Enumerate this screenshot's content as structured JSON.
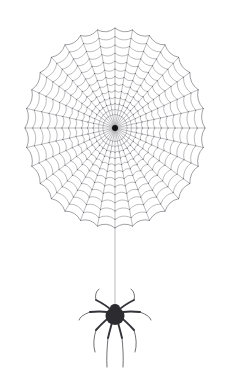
{
  "artwork": {
    "title": "Spider Web With Hanging Spider",
    "subject": "spider-web",
    "background_color": "#ffffff",
    "canvas": {
      "width": 227,
      "height": 390
    }
  },
  "web": {
    "name": "orb-web",
    "center": {
      "x": 115,
      "y": 128
    },
    "radius_x": 90,
    "radius_y": 100,
    "radial_count": 32,
    "ring_count": 13,
    "inner_hub_radius": 3,
    "first_ring_radius_fraction": 0.1,
    "sag": 0.2,
    "stroke_color": "#6b6b72",
    "stroke_width": 0.45,
    "hub_color": "#111111",
    "frame_stroke_color": "#55555c",
    "frame_stroke_width": 0.55,
    "node_color": "#3a3a42",
    "node_radius": 0.45
  },
  "dragline": {
    "name": "drop-silk-thread",
    "x": 115,
    "y_start": 228,
    "y_end": 308,
    "stroke_color": "#8d8d94",
    "stroke_width": 0.6
  },
  "spider": {
    "name": "hanging-spider",
    "center": {
      "x": 115,
      "y": 315
    },
    "abdomen_rx": 9.5,
    "abdomen_ry": 9.0,
    "cephalothorax_rx": 5.0,
    "cephalothorax_ry": 4.0,
    "body_color": "#2b2b30",
    "leg_color": "#33333a",
    "leg_count": 8,
    "leg_width_base": 1.9,
    "leg_width_tip": 0.7,
    "legs": [
      {
        "id": "leg-front-left",
        "knee_x": 96,
        "knee_y": 300,
        "tip_x": 99,
        "tip_y": 289
      },
      {
        "id": "leg-front-right",
        "knee_x": 134,
        "knee_y": 300,
        "tip_x": 131,
        "tip_y": 289
      },
      {
        "id": "leg-second-left",
        "knee_x": 90,
        "knee_y": 312,
        "tip_x": 79,
        "tip_y": 320
      },
      {
        "id": "leg-second-right",
        "knee_x": 140,
        "knee_y": 312,
        "tip_x": 151,
        "tip_y": 320
      },
      {
        "id": "leg-third-left",
        "knee_x": 96,
        "knee_y": 330,
        "tip_x": 95,
        "tip_y": 352
      },
      {
        "id": "leg-third-right",
        "knee_x": 134,
        "knee_y": 330,
        "tip_x": 135,
        "tip_y": 352
      },
      {
        "id": "leg-hind-left",
        "knee_x": 108,
        "knee_y": 338,
        "tip_x": 107,
        "tip_y": 367
      },
      {
        "id": "leg-hind-right",
        "knee_x": 122,
        "knee_y": 338,
        "tip_x": 123,
        "tip_y": 367
      }
    ]
  }
}
